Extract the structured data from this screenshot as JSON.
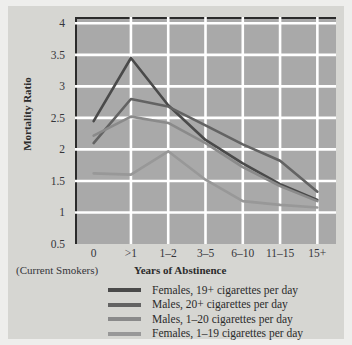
{
  "chart_data": {
    "type": "line",
    "title": "",
    "xlabel": "Years of Abstinence",
    "ylabel": "Mortality Ratio",
    "x_note": "(Current Smokers)",
    "categories": [
      "0",
      ">1",
      "1–2",
      "3–5",
      "6–10",
      "11–15",
      "15+"
    ],
    "y_ticks": [
      "4",
      "3.5",
      "3",
      "2.5",
      "2",
      "1.5",
      "1",
      "0.5"
    ],
    "y_tick_values": [
      4,
      3.5,
      3,
      2.5,
      2,
      1.5,
      1,
      0.5
    ],
    "ylim": [
      0.5,
      4.1
    ],
    "grid": true,
    "grid_color": "#ffffff",
    "plot_background": "#a9a9a9",
    "figure_background": "#d6d6d2",
    "legend_position": "bottom",
    "series": [
      {
        "name": "Females, 19+ cigarettes per day",
        "color": "#4a4a4a",
        "values": [
          2.45,
          3.45,
          2.7,
          2.15,
          1.78,
          1.45,
          1.2
        ]
      },
      {
        "name": "Males, 20+ cigarettes per day",
        "color": "#636363",
        "values": [
          2.1,
          2.8,
          2.68,
          2.38,
          2.08,
          1.82,
          1.33
        ]
      },
      {
        "name": "Males, 1–20 cigarettes per day",
        "color": "#8a8a8a",
        "values": [
          2.22,
          2.52,
          2.42,
          2.1,
          1.72,
          1.42,
          1.18
        ]
      },
      {
        "name": "Females, 1–19 cigarettes per day",
        "color": "#989898",
        "values": [
          1.62,
          1.6,
          1.97,
          1.52,
          1.18,
          1.12,
          1.08
        ]
      }
    ]
  }
}
